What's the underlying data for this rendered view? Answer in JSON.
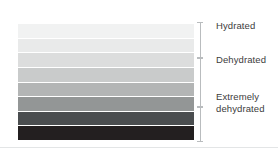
{
  "figure": {
    "background_color": "#ffffff",
    "divider_color": "#e3e5e6",
    "bracket_color": "#b9bcbe",
    "label_color": "#3c3c3c"
  },
  "chart_data": {
    "type": "heatmap",
    "xlabel": "",
    "ylabel": "",
    "orientation": "vertical-stack",
    "categories": [
      "Level 1",
      "Level 2",
      "Level 3",
      "Level 4",
      "Level 5",
      "Level 6",
      "Level 7",
      "Level 8"
    ],
    "values": [
      1,
      2,
      3,
      4,
      5,
      6,
      7,
      8
    ],
    "colors": [
      "#f1f2f2",
      "#e9eaea",
      "#dcdddd",
      "#c9cbcb",
      "#b3b5b5",
      "#939696",
      "#4a4d4f",
      "#231f20"
    ],
    "legend_position": "right",
    "grid": false,
    "annotations": [
      {
        "label": "Hydrated",
        "bands": [
          1,
          2,
          3
        ],
        "bracket_top_pct": 0,
        "bracket_height_pct": 30
      },
      {
        "label": "Dehydrated",
        "bands": [
          4,
          5,
          6
        ],
        "bracket_top_pct": 30,
        "bracket_height_pct": 41
      },
      {
        "label": "Extremely\ndehydrated",
        "bands": [
          7,
          8
        ],
        "bracket_top_pct": 71,
        "bracket_height_pct": 29
      }
    ]
  },
  "bands": [
    {
      "name": "band-1",
      "color": "#f1f2f2"
    },
    {
      "name": "band-2",
      "color": "#e9eaea"
    },
    {
      "name": "band-3",
      "color": "#dcdddd"
    },
    {
      "name": "band-4",
      "color": "#c9cbcb"
    },
    {
      "name": "band-5",
      "color": "#b3b5b5"
    },
    {
      "name": "band-6",
      "color": "#939696"
    },
    {
      "name": "band-7",
      "color": "#4a4d4f"
    },
    {
      "name": "band-8",
      "color": "#231f20"
    }
  ],
  "groups": [
    {
      "id": "hydrated",
      "label": "Hydrated",
      "top": 0,
      "height": 36,
      "label_top": 20
    },
    {
      "id": "dehydrated",
      "label": "Dehydrated",
      "top": 36,
      "height": 49,
      "label_top": 54
    },
    {
      "id": "extremely-dehydrated",
      "label": "Extremely\ndehydrated",
      "top": 85,
      "height": 35,
      "label_top": 91
    }
  ]
}
